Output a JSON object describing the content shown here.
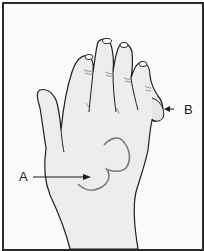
{
  "figure": {
    "type": "anatomical-illustration",
    "labels": [
      {
        "id": "A",
        "text": "A",
        "points_to": "swelling on back of hand"
      },
      {
        "id": "B",
        "text": "B",
        "points_to": "swelling on side of little finger"
      }
    ]
  },
  "colors": {
    "border": "#2a2a2a",
    "background": "#fafafa",
    "skin": "#ededed",
    "outline": "#1e1e1e",
    "shading": "#8a8a8a"
  }
}
